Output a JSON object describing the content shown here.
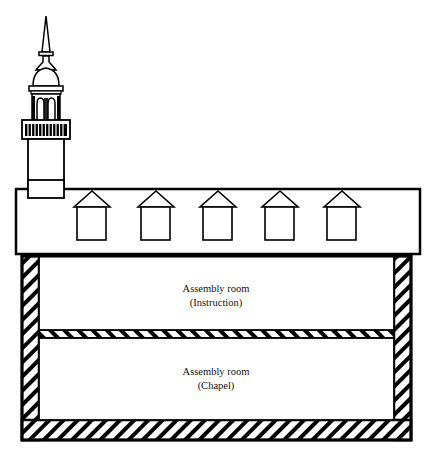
{
  "diagram": {
    "type": "building-cross-section",
    "colors": {
      "stroke": "#000000",
      "fill": "#ffffff",
      "text": "#111111"
    },
    "tower": {
      "label": "Tower with spire"
    },
    "roof": {
      "dormer_count": 5
    },
    "rooms": [
      {
        "name": "Assembly room",
        "purpose": "(Instruction)"
      },
      {
        "name": "Assembly room",
        "purpose": "(Chapel)"
      }
    ]
  }
}
